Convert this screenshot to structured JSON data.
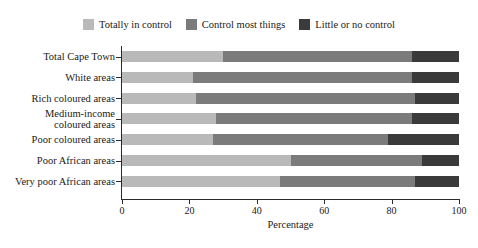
{
  "figure": {
    "cropped_title_fragment": "",
    "axis_title_x": "Percentage"
  },
  "legend": {
    "position": "top-center",
    "items": [
      {
        "label": "Totally in control",
        "color": "#b9b9b9",
        "icon": "legend-swatch-icon"
      },
      {
        "label": "Control most things",
        "color": "#7b7b7b",
        "icon": "legend-swatch-icon"
      },
      {
        "label": "Little or no control",
        "color": "#3a3a3a",
        "icon": "legend-swatch-icon"
      }
    ]
  },
  "axis": {
    "x_ticks": [
      "0",
      "20",
      "40",
      "60",
      "80",
      "100"
    ],
    "x_label": "Percentage"
  },
  "categories_display": [
    {
      "line1": "Total Cape Town",
      "line2": ""
    },
    {
      "line1": "White areas",
      "line2": ""
    },
    {
      "line1": "Rich coloured areas",
      "line2": ""
    },
    {
      "line1": "Medium-income",
      "line2": "coloured areas"
    },
    {
      "line1": "Poor coloured areas",
      "line2": ""
    },
    {
      "line1": "Poor African areas",
      "line2": ""
    },
    {
      "line1": "Very poor African areas",
      "line2": ""
    }
  ],
  "chart_data": {
    "type": "bar",
    "orientation": "horizontal",
    "stacked": true,
    "title": "",
    "xlabel": "Percentage",
    "ylabel": "",
    "xlim": [
      0,
      100
    ],
    "xticks": [
      0,
      20,
      40,
      60,
      80,
      100
    ],
    "grid": false,
    "legend_position": "top-center",
    "categories": [
      "Total Cape Town",
      "White areas",
      "Rich coloured areas",
      "Medium-income coloured areas",
      "Poor coloured areas",
      "Poor African areas",
      "Very poor African areas"
    ],
    "series": [
      {
        "name": "Totally in control",
        "color": "#b9b9b9",
        "values": [
          30,
          21,
          22,
          28,
          27,
          50,
          47
        ]
      },
      {
        "name": "Control most things",
        "color": "#7b7b7b",
        "values": [
          56,
          65,
          65,
          58,
          52,
          39,
          40
        ]
      },
      {
        "name": "Little or no control",
        "color": "#3a3a3a",
        "values": [
          14,
          14,
          13,
          14,
          21,
          11,
          13
        ]
      }
    ]
  }
}
